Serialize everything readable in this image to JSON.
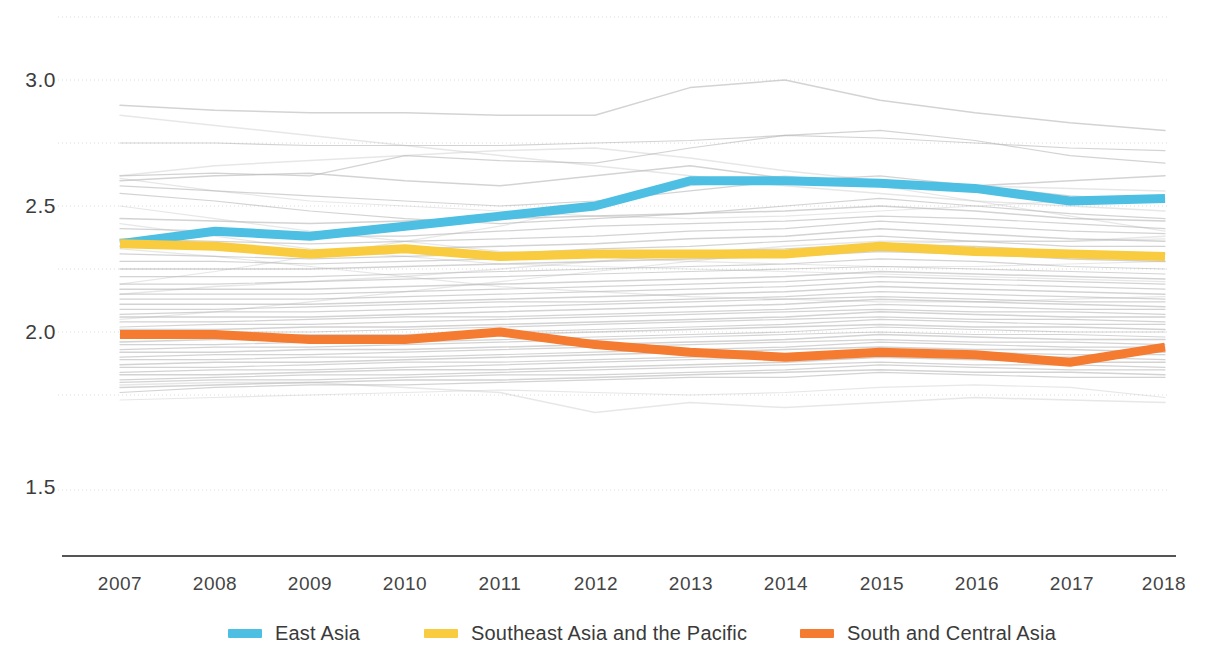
{
  "chart_data": {
    "type": "line",
    "title": "",
    "subtitle": "",
    "xlabel": "",
    "ylabel": "",
    "x": [
      2007,
      2008,
      2009,
      2010,
      2011,
      2012,
      2013,
      2014,
      2015,
      2016,
      2017,
      2018
    ],
    "xtick_labels": [
      "2007",
      "2008",
      "2009",
      "2010",
      "2011",
      "2012",
      "2013",
      "2014",
      "2015",
      "2016",
      "2017",
      "2018"
    ],
    "ytick_labels": [
      "3.0",
      "2.5",
      "2.0",
      "1.5"
    ],
    "ytick_values": [
      3.0,
      2.5,
      2.0,
      1.5
    ],
    "gridline_values": [
      3.25,
      3.0,
      2.75,
      2.5,
      2.25,
      2.0,
      1.75
    ],
    "grid": true,
    "legend_position": "bottom",
    "ylim": [
      1.42,
      3.3
    ],
    "xlim": [
      2007,
      2018
    ],
    "series": [
      {
        "name": "East Asia",
        "color": "#4cbfe3",
        "highlight": true,
        "values": [
          2.35,
          2.4,
          2.38,
          2.42,
          2.46,
          2.5,
          2.6,
          2.6,
          2.59,
          2.57,
          2.52,
          2.53
        ]
      },
      {
        "name": "Southeast Asia and the Pacific",
        "color": "#f9cb3e",
        "highlight": true,
        "values": [
          2.35,
          2.34,
          2.31,
          2.33,
          2.3,
          2.31,
          2.31,
          2.31,
          2.34,
          2.32,
          2.31,
          2.3
        ]
      },
      {
        "name": "South and Central Asia",
        "color": "#f47b30",
        "highlight": true,
        "values": [
          1.99,
          1.99,
          1.97,
          1.97,
          2.0,
          1.95,
          1.92,
          1.9,
          1.92,
          1.91,
          1.88,
          1.94
        ]
      }
    ],
    "background_series": {
      "color": "#b8b8b8",
      "description": "Unlabelled grey background country lines",
      "count": 52,
      "values": [
        [
          2.9,
          2.88,
          2.87,
          2.87,
          2.86,
          2.86,
          2.97,
          3.0,
          2.92,
          2.87,
          2.83,
          2.8
        ],
        [
          2.75,
          2.75,
          2.74,
          2.74,
          2.74,
          2.75,
          2.76,
          2.78,
          2.77,
          2.75,
          2.73,
          2.72
        ],
        [
          2.62,
          2.63,
          2.62,
          2.7,
          2.68,
          2.67,
          2.73,
          2.78,
          2.8,
          2.76,
          2.7,
          2.67
        ],
        [
          2.6,
          2.62,
          2.63,
          2.6,
          2.58,
          2.62,
          2.66,
          2.61,
          2.58,
          2.58,
          2.6,
          2.62
        ],
        [
          2.58,
          2.56,
          2.54,
          2.52,
          2.5,
          2.52,
          2.56,
          2.6,
          2.62,
          2.58,
          2.54,
          2.52
        ],
        [
          2.55,
          2.52,
          2.48,
          2.45,
          2.43,
          2.45,
          2.47,
          2.5,
          2.53,
          2.5,
          2.47,
          2.45
        ],
        [
          2.45,
          2.44,
          2.43,
          2.44,
          2.45,
          2.46,
          2.47,
          2.48,
          2.5,
          2.48,
          2.45,
          2.44
        ],
        [
          2.41,
          2.4,
          2.38,
          2.38,
          2.4,
          2.42,
          2.43,
          2.44,
          2.46,
          2.45,
          2.43,
          2.41
        ],
        [
          2.37,
          2.36,
          2.35,
          2.36,
          2.37,
          2.38,
          2.4,
          2.41,
          2.44,
          2.42,
          2.4,
          2.39
        ],
        [
          2.34,
          2.33,
          2.32,
          2.33,
          2.34,
          2.35,
          2.37,
          2.38,
          2.41,
          2.39,
          2.37,
          2.36
        ],
        [
          2.31,
          2.3,
          2.29,
          2.3,
          2.31,
          2.33,
          2.34,
          2.36,
          2.38,
          2.36,
          2.34,
          2.34
        ],
        [
          2.28,
          2.28,
          2.27,
          2.28,
          2.29,
          2.3,
          2.32,
          2.33,
          2.35,
          2.34,
          2.32,
          2.31
        ],
        [
          2.25,
          2.25,
          2.25,
          2.26,
          2.27,
          2.28,
          2.29,
          2.3,
          2.32,
          2.31,
          2.29,
          2.28
        ],
        [
          2.22,
          2.22,
          2.22,
          2.23,
          2.24,
          2.25,
          2.26,
          2.27,
          2.29,
          2.28,
          2.26,
          2.25
        ],
        [
          2.19,
          2.19,
          2.2,
          2.21,
          2.22,
          2.23,
          2.24,
          2.25,
          2.26,
          2.25,
          2.24,
          2.23
        ],
        [
          2.17,
          2.17,
          2.17,
          2.18,
          2.19,
          2.2,
          2.21,
          2.22,
          2.24,
          2.23,
          2.22,
          2.21
        ],
        [
          2.15,
          2.15,
          2.15,
          2.16,
          2.17,
          2.18,
          2.19,
          2.2,
          2.22,
          2.21,
          2.2,
          2.19
        ],
        [
          2.13,
          2.13,
          2.13,
          2.14,
          2.15,
          2.16,
          2.17,
          2.18,
          2.2,
          2.19,
          2.18,
          2.17
        ],
        [
          2.11,
          2.11,
          2.11,
          2.12,
          2.13,
          2.14,
          2.15,
          2.16,
          2.18,
          2.17,
          2.16,
          2.15
        ],
        [
          2.09,
          2.09,
          2.1,
          2.11,
          2.12,
          2.12,
          2.13,
          2.14,
          2.16,
          2.15,
          2.14,
          2.13
        ],
        [
          2.07,
          2.08,
          2.08,
          2.09,
          2.1,
          2.11,
          2.12,
          2.13,
          2.14,
          2.13,
          2.12,
          2.12
        ],
        [
          2.06,
          2.06,
          2.06,
          2.07,
          2.08,
          2.09,
          2.1,
          2.11,
          2.13,
          2.12,
          2.11,
          2.1
        ],
        [
          2.04,
          2.04,
          2.05,
          2.06,
          2.06,
          2.07,
          2.08,
          2.09,
          2.11,
          2.1,
          2.09,
          2.09
        ],
        [
          2.02,
          2.03,
          2.03,
          2.04,
          2.05,
          2.06,
          2.07,
          2.08,
          2.09,
          2.08,
          2.08,
          2.07
        ],
        [
          2.01,
          2.01,
          2.02,
          2.02,
          2.03,
          2.04,
          2.05,
          2.06,
          2.08,
          2.07,
          2.06,
          2.06
        ],
        [
          1.99,
          2.0,
          2.0,
          2.01,
          2.02,
          2.03,
          2.04,
          2.05,
          2.06,
          2.05,
          2.05,
          2.04
        ],
        [
          1.98,
          1.98,
          1.99,
          1.99,
          2.0,
          2.01,
          2.02,
          2.03,
          2.05,
          2.04,
          2.03,
          2.03
        ],
        [
          1.96,
          1.97,
          1.97,
          1.98,
          1.99,
          2.0,
          2.01,
          2.02,
          2.03,
          2.02,
          2.02,
          2.01
        ],
        [
          1.95,
          1.95,
          1.96,
          1.96,
          1.97,
          1.98,
          1.99,
          2.0,
          2.02,
          2.01,
          2.0,
          2.0
        ],
        [
          1.93,
          1.94,
          1.94,
          1.95,
          1.96,
          1.97,
          1.98,
          1.99,
          2.0,
          1.99,
          1.99,
          1.98
        ],
        [
          1.92,
          1.92,
          1.93,
          1.93,
          1.94,
          1.95,
          1.96,
          1.97,
          1.99,
          1.98,
          1.97,
          1.97
        ],
        [
          1.9,
          1.91,
          1.91,
          1.92,
          1.93,
          1.94,
          1.95,
          1.96,
          1.97,
          1.96,
          1.96,
          1.95
        ],
        [
          1.89,
          1.89,
          1.9,
          1.9,
          1.91,
          1.92,
          1.93,
          1.94,
          1.96,
          1.95,
          1.94,
          1.94
        ],
        [
          1.87,
          1.88,
          1.88,
          1.89,
          1.9,
          1.91,
          1.92,
          1.93,
          1.94,
          1.93,
          1.93,
          1.92
        ],
        [
          1.86,
          1.86,
          1.87,
          1.88,
          1.88,
          1.89,
          1.9,
          1.91,
          1.93,
          1.92,
          1.91,
          1.91
        ],
        [
          1.84,
          1.85,
          1.85,
          1.86,
          1.87,
          1.88,
          1.89,
          1.9,
          1.91,
          1.9,
          1.9,
          1.89
        ],
        [
          1.83,
          1.83,
          1.84,
          1.85,
          1.85,
          1.86,
          1.87,
          1.88,
          1.9,
          1.89,
          1.88,
          1.88
        ],
        [
          1.81,
          1.82,
          1.83,
          1.83,
          1.84,
          1.85,
          1.86,
          1.87,
          1.88,
          1.87,
          1.87,
          1.86
        ],
        [
          1.8,
          1.81,
          1.81,
          1.82,
          1.83,
          1.83,
          1.84,
          1.85,
          1.87,
          1.86,
          1.85,
          1.85
        ],
        [
          1.78,
          1.79,
          1.8,
          1.81,
          1.81,
          1.82,
          1.83,
          1.84,
          1.85,
          1.84,
          1.84,
          1.83
        ],
        [
          1.76,
          1.78,
          1.79,
          1.79,
          1.8,
          1.81,
          1.82,
          1.82,
          1.84,
          1.83,
          1.82,
          1.82
        ],
        [
          2.43,
          2.38,
          2.33,
          2.3,
          2.27,
          2.26,
          2.25,
          2.24,
          2.23,
          2.22,
          2.21,
          2.2
        ],
        [
          2.15,
          2.18,
          2.2,
          2.22,
          2.25,
          2.28,
          2.31,
          2.34,
          2.36,
          2.36,
          2.36,
          2.38
        ],
        [
          2.5,
          2.45,
          2.4,
          2.36,
          2.32,
          2.3,
          2.28,
          2.27,
          2.26,
          2.26,
          2.27,
          2.28
        ],
        [
          2.05,
          2.08,
          2.12,
          2.16,
          2.2,
          2.24,
          2.28,
          2.32,
          2.35,
          2.36,
          2.36,
          2.37
        ],
        [
          2.62,
          2.66,
          2.68,
          2.7,
          2.72,
          2.73,
          2.69,
          2.64,
          2.6,
          2.58,
          2.57,
          2.56
        ],
        [
          2.33,
          2.3,
          2.26,
          2.22,
          2.18,
          2.16,
          2.14,
          2.13,
          2.12,
          2.12,
          2.13,
          2.14
        ],
        [
          1.73,
          1.74,
          1.75,
          1.76,
          1.77,
          1.76,
          1.75,
          1.76,
          1.78,
          1.79,
          1.78,
          1.74
        ],
        [
          1.79,
          1.8,
          1.8,
          1.78,
          1.76,
          1.68,
          1.72,
          1.7,
          1.72,
          1.74,
          1.73,
          1.72
        ],
        [
          2.61,
          2.56,
          2.52,
          2.5,
          2.48,
          2.46,
          2.45,
          2.46,
          2.48,
          2.5,
          2.52,
          2.53
        ],
        [
          2.19,
          2.24,
          2.3,
          2.36,
          2.42,
          2.5,
          2.58,
          2.62,
          2.58,
          2.52,
          2.46,
          2.4
        ],
        [
          2.86,
          2.82,
          2.78,
          2.74,
          2.7,
          2.66,
          2.62,
          2.58,
          2.55,
          2.52,
          2.5,
          2.48
        ]
      ]
    }
  },
  "legend": {
    "items": [
      {
        "label": "East Asia",
        "color": "#4cbfe3"
      },
      {
        "label": "Southeast Asia and the Pacific",
        "color": "#f9cb3e"
      },
      {
        "label": "South and Central Asia",
        "color": "#f47b30"
      }
    ]
  },
  "axis": {
    "axis_line_color": "#555555",
    "grid_color": "#dcdcdc"
  }
}
